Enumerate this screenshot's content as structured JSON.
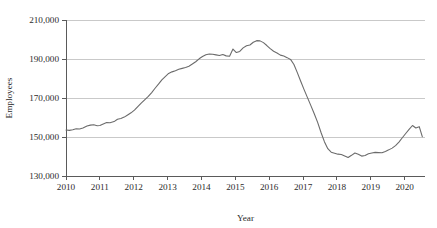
{
  "chart_data": {
    "type": "line",
    "title": "",
    "subtitle": "",
    "xlabel": "Year",
    "ylabel": "Employees",
    "xlim": [
      2010.0,
      2020.6
    ],
    "ylim": [
      130000,
      210000
    ],
    "grid": true,
    "legend": "none",
    "x_tick_labels": [
      "2010",
      "2011",
      "2012",
      "2013",
      "2014",
      "2015",
      "2016",
      "2017",
      "2018",
      "2019",
      "2020"
    ],
    "x_tick_values": [
      2010,
      2011,
      2012,
      2013,
      2014,
      2015,
      2016,
      2017,
      2018,
      2019,
      2020
    ],
    "y_tick_labels": [
      "130,000",
      "150,000",
      "170,000",
      "190,000",
      "210,000"
    ],
    "y_tick_values": [
      130000,
      150000,
      170000,
      190000,
      210000
    ],
    "line_color": "#6b6b6b",
    "grid_color": "#c9c9c9",
    "axis_color": "#5a5a5a",
    "series": [
      {
        "name": "Employees",
        "x": [
          2010.0,
          2010.1,
          2010.2,
          2010.3,
          2010.4,
          2010.5,
          2010.62,
          2010.72,
          2010.82,
          2010.92,
          2011.0,
          2011.1,
          2011.2,
          2011.3,
          2011.42,
          2011.52,
          2011.62,
          2011.72,
          2011.82,
          2011.92,
          2012.02,
          2012.12,
          2012.22,
          2012.33,
          2012.43,
          2012.53,
          2012.63,
          2012.73,
          2012.83,
          2012.93,
          2013.03,
          2013.13,
          2013.23,
          2013.33,
          2013.43,
          2013.53,
          2013.63,
          2013.73,
          2013.83,
          2013.93,
          2014.03,
          2014.13,
          2014.23,
          2014.33,
          2014.43,
          2014.53,
          2014.63,
          2014.73,
          2014.83,
          2014.93,
          2015.03,
          2015.13,
          2015.23,
          2015.33,
          2015.43,
          2015.53,
          2015.63,
          2015.73,
          2015.83,
          2015.93,
          2016.03,
          2016.13,
          2016.23,
          2016.33,
          2016.43,
          2016.53,
          2016.63,
          2016.73,
          2016.83,
          2016.93,
          2017.03,
          2017.13,
          2017.23,
          2017.33,
          2017.43,
          2017.53,
          2017.63,
          2017.73,
          2017.83,
          2017.93,
          2018.03,
          2018.13,
          2018.23,
          2018.33,
          2018.43,
          2018.53,
          2018.63,
          2018.73,
          2018.83,
          2018.93,
          2019.03,
          2019.13,
          2019.23,
          2019.33,
          2019.43,
          2019.53,
          2019.63,
          2019.73,
          2019.83,
          2019.93,
          2020.03,
          2020.13,
          2020.23,
          2020.33,
          2020.43,
          2020.52
        ],
        "y": [
          153600,
          153400,
          153700,
          154200,
          154100,
          154600,
          155600,
          156100,
          156300,
          155800,
          155900,
          156700,
          157400,
          157300,
          157900,
          159100,
          159500,
          160200,
          161300,
          162400,
          163800,
          165600,
          167400,
          169200,
          170800,
          172800,
          175000,
          177100,
          179300,
          181000,
          182600,
          183400,
          184000,
          184700,
          185200,
          185600,
          186300,
          187400,
          188600,
          190100,
          191300,
          192200,
          192600,
          192400,
          192100,
          191800,
          192300,
          191600,
          191400,
          195100,
          193300,
          193900,
          195700,
          196800,
          197200,
          198600,
          199400,
          199300,
          198400,
          196900,
          195300,
          194000,
          193100,
          192000,
          191500,
          190700,
          189800,
          187200,
          183000,
          178600,
          174300,
          170200,
          166100,
          161900,
          157500,
          152300,
          147600,
          144000,
          142200,
          141700,
          141200,
          141000,
          140300,
          139500,
          140600,
          141800,
          141100,
          140200,
          140500,
          141400,
          141800,
          142100,
          142000,
          141900,
          142600,
          143400,
          144300,
          145600,
          147400,
          149600,
          151800,
          153900,
          155900,
          154600,
          155300,
          150200
        ]
      }
    ]
  },
  "axis_titles": {
    "x": "Year",
    "y": "Employees"
  }
}
